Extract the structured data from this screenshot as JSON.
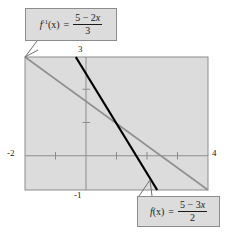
{
  "figure": {
    "background_color": "#ffffff"
  },
  "plot": {
    "area_fill": "#dcdcdc",
    "border_color": "#8c8c8c",
    "axis_color": "#8c8c8c",
    "xlim": [
      -2,
      4
    ],
    "ylim": [
      -1,
      3
    ],
    "x_axis_label_left": "-2",
    "x_axis_label_right": "4",
    "y_axis_label_top": "3",
    "y_axis_label_bottom": "-1",
    "x_ticks": [
      -1,
      1,
      2,
      3
    ],
    "y_ticks": [
      1,
      2
    ]
  },
  "callouts": {
    "inverse": {
      "lhs_f": "f",
      "lhs_sup": "-1",
      "lhs_arg": "(x)",
      "equals": "=",
      "numerator": "5 − 2x",
      "denominator": "3",
      "box_fill": "#dcdcdc",
      "box_border": "#8c8c8c"
    },
    "function": {
      "lhs_f": "f",
      "lhs_sup": "",
      "lhs_arg": "(x)",
      "equals": "=",
      "numerator": "5 − 3x",
      "denominator": "2",
      "box_fill": "#dcdcdc",
      "box_border": "#8c8c8c"
    }
  },
  "chart_data": {
    "type": "line",
    "title": "",
    "xlabel": "",
    "ylabel": "",
    "xlim": [
      -2,
      4
    ],
    "ylim": [
      -1,
      3
    ],
    "grid": false,
    "legend_position": "callout-boxes",
    "series": [
      {
        "name": "f(x) = (5 - 3x)/2",
        "color": "#000000",
        "width": 2.2,
        "equation": "y = (5 - 3x)/2",
        "slope": -1.5,
        "intercept": 2.5,
        "points": [
          [
            -0.3333,
            3
          ],
          [
            2.3333,
            -1
          ]
        ]
      },
      {
        "name": "f^-1(x) = (5 - 2x)/3",
        "color": "#909090",
        "width": 1.5,
        "equation": "y = (5 - 2x)/3",
        "slope": -0.6667,
        "intercept": 1.6667,
        "points": [
          [
            -2,
            3
          ],
          [
            4,
            -1
          ]
        ]
      }
    ],
    "x_tick_labels": [
      "-2",
      "4"
    ],
    "y_tick_labels": [
      "-1",
      "3"
    ]
  }
}
